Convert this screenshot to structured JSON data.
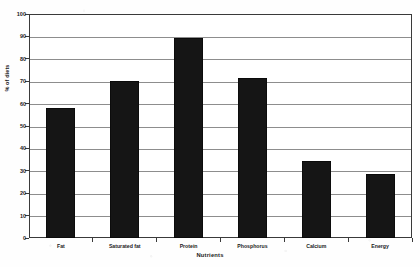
{
  "chart_data": {
    "type": "bar",
    "title": "",
    "subtitle": "",
    "xlabel": "Nutrients",
    "ylabel": "% of diets",
    "categories": [
      "Fat",
      "Saturated fat",
      "Protein",
      "Phosphorus",
      "Calcium",
      "Energy"
    ],
    "values": [
      58,
      70,
      89.5,
      71.5,
      34.5,
      28.5
    ],
    "ylim": [
      0,
      100
    ],
    "ytick_step": 10,
    "ytick_labels": [
      "100",
      "90",
      "80",
      "70",
      "60",
      "50",
      "40",
      "30",
      "20",
      "10",
      "0"
    ],
    "grid": true,
    "grid_axis": "y",
    "legend": false,
    "legend_position": "none",
    "bar_color": "#151515",
    "grid_color": "#8d8d8d",
    "axis_color": "#3a3a3a",
    "background_color": "#ffffff",
    "annotations": []
  }
}
